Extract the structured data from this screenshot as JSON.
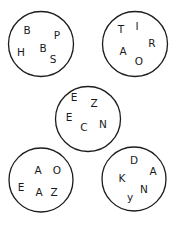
{
  "puzzle": {
    "circles": [
      {
        "id": "top-left",
        "letters": [
          "B",
          "H",
          "B",
          "P",
          "S"
        ]
      },
      {
        "id": "top-right",
        "letters": [
          "T",
          "I",
          "R",
          "A",
          "O"
        ]
      },
      {
        "id": "middle",
        "letters": [
          "E",
          "Z",
          "E",
          "C",
          "N"
        ]
      },
      {
        "id": "bottom-left",
        "letters": [
          "A",
          "O",
          "E",
          "A",
          "Z"
        ]
      },
      {
        "id": "bottom-right",
        "letters": [
          "D",
          "A",
          "K",
          "N",
          "y"
        ]
      }
    ]
  }
}
